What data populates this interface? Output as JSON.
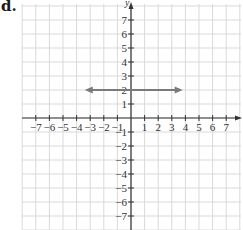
{
  "panel_label": "d.",
  "chart_data": {
    "type": "line",
    "title": "",
    "xlabel": "x",
    "ylabel": "y",
    "xlim": [
      -8,
      8
    ],
    "ylim": [
      -8,
      8
    ],
    "grid": true,
    "x_ticks": [
      -7,
      -6,
      -5,
      -4,
      -3,
      -2,
      -1,
      1,
      2,
      3,
      4,
      5,
      6,
      7
    ],
    "y_ticks": [
      7,
      6,
      5,
      4,
      3,
      2,
      1,
      -1,
      -2,
      -3,
      -4,
      -5,
      -6,
      -7
    ],
    "x_tick_labels": [
      "−7",
      "−6",
      "−5",
      "−4",
      "−3",
      "−2",
      "−1",
      "1",
      "2",
      "3",
      "4",
      "5",
      "6",
      "7"
    ],
    "y_tick_labels": [
      "7",
      "6",
      "5",
      "4",
      "3",
      "2",
      "1",
      "−1",
      "−2",
      "−3",
      "−4",
      "−5",
      "−6",
      "−7"
    ],
    "series": [
      {
        "name": "y = 2",
        "equation": "y = 2",
        "x": [
          -3.4,
          3.8
        ],
        "y": [
          2,
          2
        ],
        "arrows": "both",
        "color": "#7a7a7a"
      }
    ],
    "colors": {
      "grid": "#d9d9d9",
      "axis": "#333333",
      "line": "#7a7a7a"
    }
  }
}
